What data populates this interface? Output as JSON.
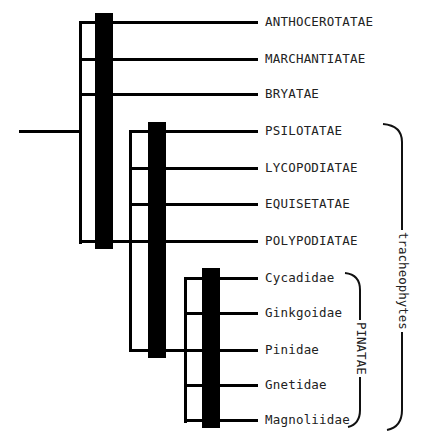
{
  "diagram": {
    "type": "cladogram",
    "taxa": [
      {
        "label": "ANTHOCEROTATAE"
      },
      {
        "label": "MARCHANTIATAE"
      },
      {
        "label": "BRYATAE"
      },
      {
        "label": "PSILOTATAE"
      },
      {
        "label": "LYCOPODIATAE"
      },
      {
        "label": "EQUISETATAE"
      },
      {
        "label": "POLYPODIATAE"
      },
      {
        "label": "Cycadidae"
      },
      {
        "label": "Ginkgoidae"
      },
      {
        "label": "Pinidae"
      },
      {
        "label": "Gnetidae"
      },
      {
        "label": "Magnoliidae"
      }
    ],
    "brackets": {
      "tracheophytes": {
        "label": "tracheophytes",
        "from": "PSILOTATAE",
        "to": "Magnoliidae"
      },
      "pinatae": {
        "label": "PINATAE",
        "from": "Cycadidae",
        "to": "Magnoliidae"
      }
    },
    "caption": ""
  }
}
